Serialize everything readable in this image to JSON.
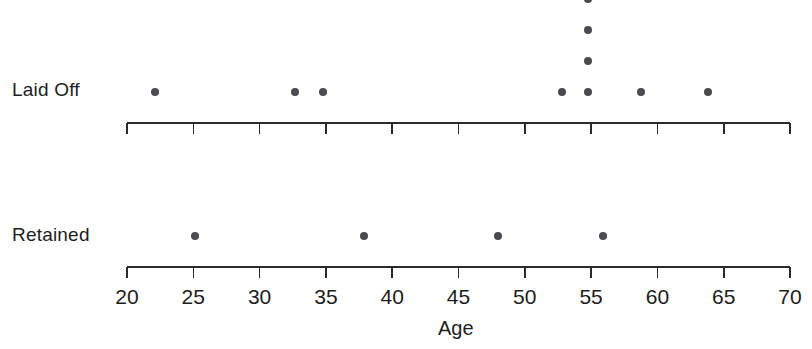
{
  "chart_data": {
    "type": "scatter",
    "title": "",
    "subtitle": "",
    "xlabel": "Age",
    "ylabel": "",
    "xlim": [
      20,
      70
    ],
    "xticks": [
      20,
      25,
      30,
      35,
      40,
      45,
      50,
      55,
      60,
      65,
      70
    ],
    "xticklabels": [
      "20",
      "25",
      "30",
      "35",
      "40",
      "45",
      "50",
      "55",
      "60",
      "65",
      "70"
    ],
    "grid": false,
    "legend": "none",
    "point_color": "#4a4a4f",
    "axis_color": "#2b2b2b",
    "background_color": "#ffffff",
    "groups": [
      {
        "name": "Laid Off",
        "label": "Laid Off",
        "n": 10,
        "values": [
          22.1,
          32.7,
          34.8,
          52.8,
          54.8,
          54.8,
          54.8,
          54.8,
          58.8,
          63.8
        ],
        "stacks": [
          {
            "age": 22.1,
            "count": 1
          },
          {
            "age": 32.7,
            "count": 1
          },
          {
            "age": 34.8,
            "count": 1
          },
          {
            "age": 52.8,
            "count": 1
          },
          {
            "age": 54.8,
            "count": 4
          },
          {
            "age": 58.8,
            "count": 1
          },
          {
            "age": 63.8,
            "count": 1
          }
        ]
      },
      {
        "name": "Retained",
        "label": "Retained",
        "n": 4,
        "values": [
          25.1,
          37.9,
          48.0,
          55.9
        ],
        "stacks": [
          {
            "age": 25.1,
            "count": 1
          },
          {
            "age": 37.9,
            "count": 1
          },
          {
            "age": 48.0,
            "count": 1
          },
          {
            "age": 55.9,
            "count": 1
          }
        ]
      }
    ]
  },
  "labels": {
    "group_laid_off": "Laid Off",
    "group_retained": "Retained",
    "axis_title": "Age"
  }
}
